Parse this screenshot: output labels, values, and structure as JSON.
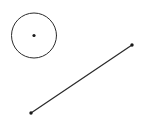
{
  "canvas": {
    "width": 141,
    "height": 128,
    "background_color": "#ffffff",
    "title": ""
  },
  "style": {
    "stroke_color": "#2b2b2b",
    "dot_color": "#1a1a1a",
    "stroke_width": 1,
    "line_stroke_width": 1.25
  },
  "figures": {
    "circle": {
      "name": "circle",
      "center": {
        "x": 34,
        "y": 35.5
      },
      "radius": 22.5,
      "bounds": {
        "left": 11.5,
        "top": 13,
        "right": 56.5,
        "bottom": 58
      },
      "filled": false,
      "label": "",
      "center_point": {
        "name": "circle-center-point",
        "x": 34,
        "y": 35.5,
        "radius": 1.6,
        "label": ""
      }
    },
    "segment": {
      "name": "line-segment",
      "start": {
        "x": 31,
        "y": 113
      },
      "end": {
        "x": 132,
        "y": 45
      },
      "endpoints": [
        {
          "name": "segment-endpoint-lower-left",
          "x": 31,
          "y": 113,
          "radius": 1.7,
          "label": ""
        },
        {
          "name": "segment-endpoint-upper-right",
          "x": 132,
          "y": 45,
          "radius": 1.7,
          "label": ""
        }
      ],
      "label": ""
    }
  },
  "annotations": {
    "labels": [],
    "caption": ""
  }
}
